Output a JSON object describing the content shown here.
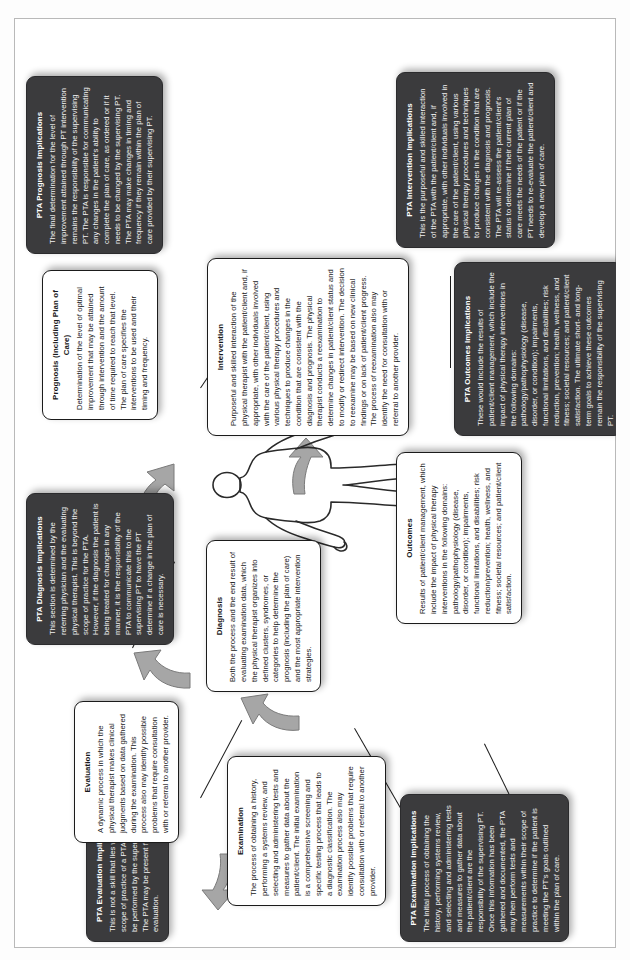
{
  "diagram": {
    "orientation": "landscape content on portrait page, rotated 90 degrees counter-clockwise",
    "colors": {
      "white_node_fill": "#ffffff",
      "white_node_border": "#1b1b1b",
      "dark_node_fill": "#3b3b3d",
      "dark_node_text": "#f2f2f2",
      "arrow_fill": "#a6a6a6",
      "arrow_stroke": "#6f6f6f",
      "connector_line": "#1b1b1b",
      "page_border": "#b9b9b9"
    },
    "nodes": [
      {
        "id": "examination",
        "kind": "white",
        "title": "Examination",
        "body": "The process of obtaining a history, performing a systems review, and selecting and administering tests and measures to gather data about the patient/client. The initial examination is a comprehensive screening and specific testing process that leads to a diagnostic classification. The examination process also may identify possible problems that require consultation with or referral to another provider."
      },
      {
        "id": "pta-examination-implications",
        "kind": "dark",
        "title": "PTA Examination Implications",
        "body": "The initial process of obtaining the history, performing systems review, and selecting and administering tests and measures to gather data about the patient/client are the responsibility of the supervising PT. Once this information has been gathered and documented, the PTA may then perform tests and measurements within their scope of practice to determine if the patient is meeting the PT's goals outlined within the plan of care."
      },
      {
        "id": "evaluation",
        "kind": "white",
        "title": "Evaluation",
        "body": "A dynamic process in which the physical therapist makes clinical judgments based on data gathered during the examination. This process also may identify possible problems that require consultation with or referral to another provider."
      },
      {
        "id": "pta-evaluation-implications",
        "kind": "dark",
        "title": "PTA Evaluation Implications",
        "body": "This is not a skill that lies within the scope of practice of a PTA and must be performed by the supervising PT. The PTA may be present for the evaluation."
      },
      {
        "id": "diagnosis",
        "kind": "white",
        "title": "Diagnosis",
        "body": "Both the process and the end result of evaluating examination data, which the physical therapist organizes into defined clusters, syndromes, or categories to help determine the prognosis (including the plan of care) and the most appropriate intervention strategies."
      },
      {
        "id": "pta-diagnosis-implications",
        "kind": "dark",
        "title": "PTA Diagnosis Implications",
        "body": "This section is determined by the referring physician and the evaluating physical therapist. This is beyond the scope of practice for the PTA. However, if the diagnosis the patient is being treated for changes in any manner, it is the responsibility of the PTA to communicate this to the supervising PT to have the PT determine if a change in the plan of care is necessary."
      },
      {
        "id": "prognosis",
        "kind": "white",
        "title": "Prognosis (Including Plan of Care)",
        "body": "Determination of the level of optimal improvement that may be attained through intervention and the amount of time required to reach that level. The plan of care specifies the interventions to be used and their timing and frequency."
      },
      {
        "id": "pta-prognosis-implications",
        "kind": "dark",
        "title": "PTA Prognosis Implications",
        "body": "The final determination for the level of improvement attained through PT intervention remains the responsibility of the supervising PT. The PTA is responsible for communicating any changes in the patient's ability to complete the plan of care, as ordered or if it needs to be changed by the supervising PT. The PTA may make changes in timing and frequency if they remain within the plan of care provided by their supervising PT."
      },
      {
        "id": "intervention",
        "kind": "white",
        "title": "Intervention",
        "body": "Purposeful and skilled interaction of the physical therapist with the patient/client and, if appropriate, with other individuals involved with the care of the patient/client, using various physical therapy procedures and techniques to produce changes in the condition that are consistent with the diagnosis and prognosis. The physical therapist conducts a reexamination to determine changes in patient/client status and to modify or redirect intervention. The decision to reexamine may be based on new clinical findings or on lack of patient/client progress. The process of reexamination also may identify the need for consultation with or referral to another provider."
      },
      {
        "id": "pta-intervention-implications",
        "kind": "dark",
        "title": "PTA Intervention Implications",
        "body": "This is the purposeful and skilled interaction of the PTA with the patient/client and, if appropriate, with other individuals involved in the care of the patient/client, using various physical therapy procedures and techniques to produce changes in the condition that are consistent with the diagnosis and prognosis. The PTA will re-assess the patient/client's status to determine if their current plan of care meets the needs of the patient or if the PT needs to re-evaluate the patient/client and develop a new plan of care."
      },
      {
        "id": "outcomes",
        "kind": "white",
        "title": "Outcomes",
        "body": "Results of patient/client management, which include the impact of physical therapy interventions in the following domains: pathology/pathophysiology (disease, disorder, or condition); impairments, functional limitations, and disabilities; risk reduction/prevention; health, wellness, and fitness; societal resources; and patient/client satisfaction."
      },
      {
        "id": "pta-outcomes-implications",
        "kind": "dark",
        "title": "PTA Outcomes Implications",
        "body": "These would include the results of patient/client management, which include the impact of physical therapy interventions in the following domains: pathology/pathophysiology (disease, disorder, or condition); impairments, functional limitations, and disabilities; risk reduction, prevention; health, wellness, and fitness; societal resources; and patient/client satisfaction. The ultimate short- and long-term goals to achieve these outcomes remain the responsibility of the supervising PT."
      }
    ],
    "figure": {
      "name": "human-body-silhouette",
      "label": ""
    },
    "flow_arrows": [
      {
        "from": "examination",
        "to": "evaluation"
      },
      {
        "from": "evaluation",
        "to": "diagnosis"
      },
      {
        "from": "diagnosis",
        "to": "prognosis"
      },
      {
        "from": "prognosis",
        "to": "intervention"
      },
      {
        "from": "intervention",
        "to": "outcomes"
      }
    ]
  }
}
